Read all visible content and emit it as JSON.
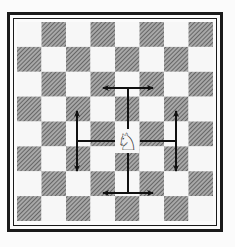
{
  "diagram": {
    "board": {
      "files": 8,
      "ranks": 8,
      "top_left_square": "light",
      "light_color": "#f7f7f7",
      "dark_color": "#8a8a8a",
      "frame_color": "#1a1a1a"
    },
    "piece": {
      "type": "knight",
      "color": "white",
      "glyph": "♘",
      "square": {
        "col": 4,
        "row": 4.5
      }
    },
    "moves": [
      {
        "name": "move-up",
        "direction": "up",
        "bar_orientation": "horizontal",
        "targets": "two squares up, one left or right"
      },
      {
        "name": "move-down",
        "direction": "down",
        "bar_orientation": "horizontal",
        "targets": "two squares down, one left or right"
      },
      {
        "name": "move-left",
        "direction": "left",
        "bar_orientation": "vertical",
        "targets": "two squares left, one up or down"
      },
      {
        "name": "move-right",
        "direction": "right",
        "bar_orientation": "vertical",
        "targets": "two squares right, one up or down"
      }
    ],
    "arrow_color": "#111111"
  }
}
